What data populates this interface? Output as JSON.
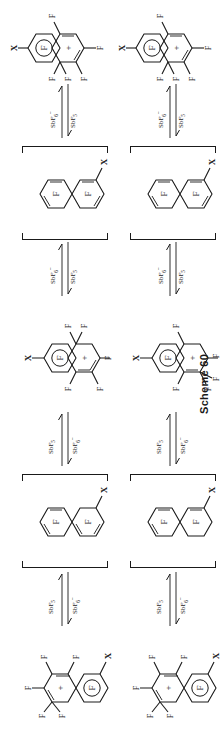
{
  "figure": {
    "caption": "Scheme 60",
    "kind": "chemical reaction scheme",
    "orientation_deg": -90,
    "background_color": "#ffffff",
    "line_color": "#1a1a1a"
  },
  "reagents": {
    "forward": "SbF5",
    "reverse": "SbF6-",
    "forward_base": "SbF",
    "forward_sub": "5",
    "reverse_base": "SbF",
    "reverse_sub": "6",
    "reverse_sup": "–"
  },
  "atom_labels": {
    "fluorine": "F",
    "substituent": "X",
    "charge": "+"
  },
  "rows": [
    {
      "id": "row-top",
      "steps": [
        {
          "type": "structure",
          "id": "s-top-1",
          "name": "fluorinated-arenium-cation-A",
          "charge": "+",
          "bracketed": false,
          "labels": [
            "F",
            "F",
            "F",
            "F",
            "F",
            "F",
            "X",
            "+"
          ]
        },
        {
          "type": "arrow",
          "id": "a-top-1",
          "forward": "SbF5",
          "reverse": "SbF6-"
        },
        {
          "type": "structure",
          "id": "s-top-2",
          "name": "fluoronaphthalene-neutral-A",
          "bracketed": true,
          "labels": [
            "F",
            "F",
            "X"
          ]
        },
        {
          "type": "arrow",
          "id": "a-top-2",
          "forward": "SbF5",
          "reverse": "SbF6-"
        },
        {
          "type": "structure",
          "id": "s-top-3",
          "name": "fluorinated-arenium-cation-B",
          "charge": "+",
          "bracketed": false,
          "labels": [
            "F",
            "F",
            "F",
            "F",
            "F",
            "F",
            "X",
            "+"
          ]
        },
        {
          "type": "arrow",
          "id": "a-top-3",
          "forward": "SbF5",
          "reverse": "SbF6-"
        },
        {
          "type": "structure",
          "id": "s-top-4",
          "name": "fluoronaphthalene-neutral-B",
          "bracketed": true,
          "labels": [
            "F",
            "F",
            "X"
          ]
        },
        {
          "type": "arrow",
          "id": "a-top-4",
          "forward": "SbF5",
          "reverse": "SbF6-"
        },
        {
          "type": "structure",
          "id": "s-top-5",
          "name": "fluorinated-arenium-cation-C",
          "charge": "+",
          "bracketed": false,
          "labels": [
            "F",
            "F",
            "F",
            "F",
            "F",
            "F",
            "X",
            "+"
          ]
        }
      ]
    },
    {
      "id": "row-bottom",
      "steps": [
        {
          "type": "structure",
          "id": "s-bot-1",
          "name": "fluorinated-arenium-cation-D",
          "charge": "+",
          "bracketed": false,
          "labels": [
            "F",
            "F",
            "F",
            "F",
            "F",
            "F",
            "X",
            "+"
          ]
        },
        {
          "type": "arrow",
          "id": "a-bot-1",
          "forward": "SbF5",
          "reverse": "SbF6-"
        },
        {
          "type": "structure",
          "id": "s-bot-2",
          "name": "fluoronaphthalene-neutral-C",
          "bracketed": true,
          "labels": [
            "F",
            "F",
            "X"
          ]
        },
        {
          "type": "arrow",
          "id": "a-bot-2",
          "forward": "SbF5",
          "reverse": "SbF6-"
        },
        {
          "type": "structure",
          "id": "s-bot-3",
          "name": "fluorinated-arenium-cation-E",
          "charge": "+",
          "bracketed": false,
          "labels": [
            "F",
            "F",
            "F",
            "F",
            "F",
            "F",
            "X",
            "+"
          ]
        },
        {
          "type": "arrow",
          "id": "a-bot-3",
          "forward": "SbF5",
          "reverse": "SbF6-"
        },
        {
          "type": "structure",
          "id": "s-bot-4",
          "name": "fluoronaphthalene-neutral-D",
          "bracketed": true,
          "labels": [
            "F",
            "F",
            "X"
          ]
        },
        {
          "type": "arrow",
          "id": "a-bot-4",
          "forward": "SbF5",
          "reverse": "SbF6-"
        },
        {
          "type": "structure",
          "id": "s-bot-5",
          "name": "fluorinated-arenium-cation-F",
          "charge": "+",
          "bracketed": false,
          "labels": [
            "F",
            "F",
            "F",
            "F",
            "F",
            "F",
            "X",
            "+"
          ]
        }
      ]
    }
  ]
}
